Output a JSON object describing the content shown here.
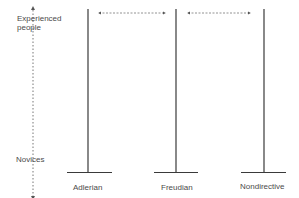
{
  "axis": {
    "top_label_line1": "Experienced",
    "top_label_line2": "people",
    "bottom_label": "Novices"
  },
  "columns": [
    {
      "label": "Adlerian",
      "x": 88
    },
    {
      "label": "Freudian",
      "x": 176
    },
    {
      "label": "Nondirective",
      "x": 264
    }
  ],
  "connectors": [
    {
      "from": "Adlerian",
      "to": "Freudian",
      "style": "dashed-double-arrow"
    },
    {
      "from": "Freudian",
      "to": "Nondirective",
      "style": "dashed-double-arrow"
    }
  ],
  "colors": {
    "line": "#3a3a3a",
    "dashed": "#777777",
    "text": "#4a4a4a"
  }
}
